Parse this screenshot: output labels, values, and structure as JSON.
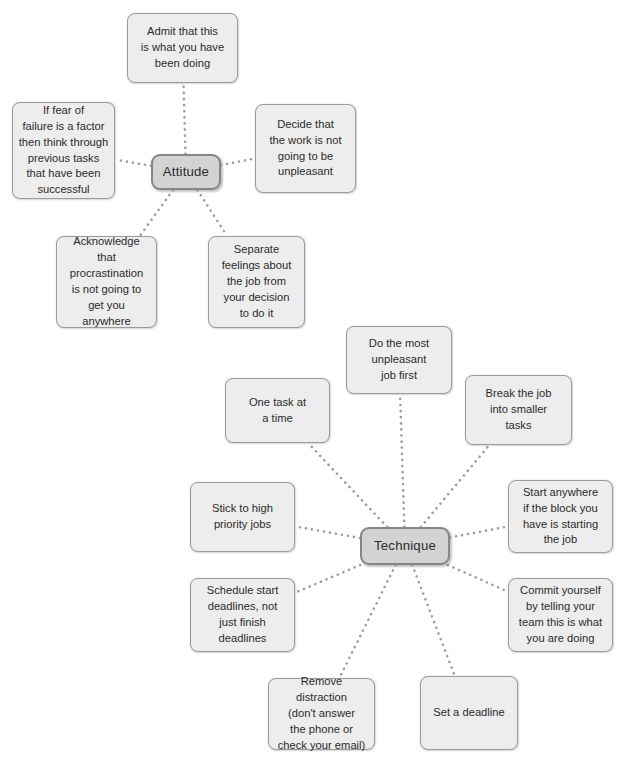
{
  "diagram": {
    "type": "mind-map",
    "colors": {
      "background": "#ffffff",
      "node_fill": "#ededed",
      "node_border": "#9b9b9b",
      "center_fill": "#d3d3d3",
      "center_border": "#868686",
      "text": "#2b2b2b",
      "connector": "#9e9e9e"
    },
    "clusters": [
      {
        "id": "attitude",
        "center": {
          "label": "Attitude",
          "x": 151,
          "y": 154,
          "w": 70,
          "h": 36
        },
        "branches": [
          {
            "id": "admit",
            "label": "Admit that this\nis what you have\nbeen doing",
            "x": 127,
            "y": 13,
            "w": 111,
            "h": 70
          },
          {
            "id": "fear-of-failure",
            "label": "If fear of\nfailure is a factor\nthen think through\nprevious tasks\nthat have been\nsuccessful",
            "x": 12,
            "y": 102,
            "w": 103,
            "h": 97
          },
          {
            "id": "decide-work-not-unpleasant",
            "label": "Decide that\nthe work is not\ngoing to be\nunpleasant",
            "x": 255,
            "y": 104,
            "w": 101,
            "h": 89
          },
          {
            "id": "acknowledge-procrastination",
            "label": "Acknowledge\nthat procrastination\nis not going to\nget you\nanywhere",
            "x": 56,
            "y": 236,
            "w": 101,
            "h": 92
          },
          {
            "id": "separate-feelings",
            "label": "Separate\nfeelings about\nthe job from\nyour decision\nto do it",
            "x": 208,
            "y": 236,
            "w": 97,
            "h": 92
          }
        ]
      },
      {
        "id": "technique",
        "center": {
          "label": "Technique",
          "x": 360,
          "y": 527,
          "w": 90,
          "h": 38
        },
        "branches": [
          {
            "id": "most-unpleasant-first",
            "label": "Do the most\nunpleasant\njob first",
            "x": 346,
            "y": 326,
            "w": 106,
            "h": 68
          },
          {
            "id": "break-into-smaller-tasks",
            "label": "Break the job\ninto smaller\ntasks",
            "x": 465,
            "y": 375,
            "w": 107,
            "h": 70
          },
          {
            "id": "one-task-at-a-time",
            "label": "One task at\na time",
            "x": 225,
            "y": 378,
            "w": 105,
            "h": 65
          },
          {
            "id": "stick-to-high-priority",
            "label": "Stick to high\npriority jobs",
            "x": 190,
            "y": 482,
            "w": 105,
            "h": 70
          },
          {
            "id": "start-anywhere",
            "label": "Start anywhere\nif the block you\nhave is starting\nthe job",
            "x": 508,
            "y": 480,
            "w": 105,
            "h": 73
          },
          {
            "id": "schedule-start-deadlines",
            "label": "Schedule start\ndeadlines, not\njust finish\ndeadlines",
            "x": 190,
            "y": 578,
            "w": 105,
            "h": 74
          },
          {
            "id": "commit-yourself",
            "label": "Commit yourself\nby telling your\nteam this is what\nyou are doing",
            "x": 508,
            "y": 578,
            "w": 105,
            "h": 74
          },
          {
            "id": "remove-distraction",
            "label": "Remove distraction\n(don't answer\nthe phone or\ncheck your email)",
            "x": 268,
            "y": 678,
            "w": 107,
            "h": 72
          },
          {
            "id": "set-a-deadline",
            "label": "Set a deadline",
            "x": 420,
            "y": 676,
            "w": 98,
            "h": 74
          }
        ]
      }
    ],
    "connections": [
      {
        "from": "attitude",
        "to": "admit"
      },
      {
        "from": "attitude",
        "to": "fear-of-failure"
      },
      {
        "from": "attitude",
        "to": "decide-work-not-unpleasant"
      },
      {
        "from": "attitude",
        "to": "acknowledge-procrastination"
      },
      {
        "from": "attitude",
        "to": "separate-feelings"
      },
      {
        "from": "technique",
        "to": "most-unpleasant-first"
      },
      {
        "from": "technique",
        "to": "break-into-smaller-tasks"
      },
      {
        "from": "technique",
        "to": "one-task-at-a-time"
      },
      {
        "from": "technique",
        "to": "stick-to-high-priority"
      },
      {
        "from": "technique",
        "to": "start-anywhere"
      },
      {
        "from": "technique",
        "to": "schedule-start-deadlines"
      },
      {
        "from": "technique",
        "to": "commit-yourself"
      },
      {
        "from": "technique",
        "to": "remove-distraction"
      },
      {
        "from": "technique",
        "to": "set-a-deadline"
      }
    ]
  }
}
